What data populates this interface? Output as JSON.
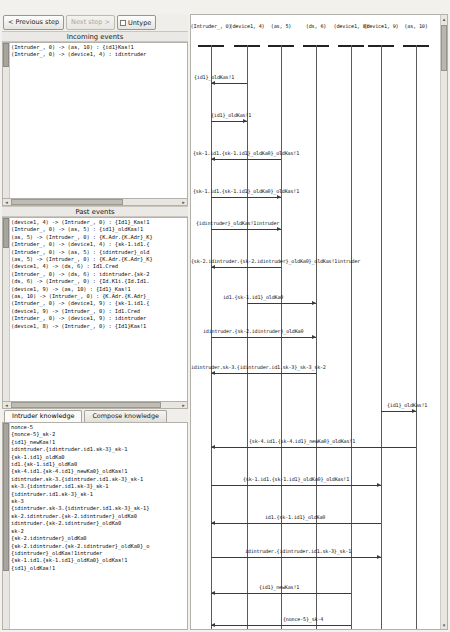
{
  "toolbar": {
    "previous_step_label": "< Previous step",
    "next_step_label": "Next step >",
    "untype_label": "Untype"
  },
  "incoming_events": {
    "title": "Incoming events",
    "rows": [
      "(Intruder_, 0) -> (as, 10) : {id1}Kas!1",
      "(Intruder_, 0) -> (device1, 4) : idintruder"
    ]
  },
  "past_events": {
    "title": "Past events",
    "rows": [
      "(device1, 4) -> (Intruder_, 0) : {Id1}_Kas!1",
      "(Intruder_, 0) -> (as, 5) : {id1}_oldKas!1",
      "(as, 5) -> (Intruder_, 0) : {K.Adr.{K.Adr}_K}",
      "(Intruder_, 0) -> (device1, 4) : {sk-1.id1.{",
      "(Intruder_, 0) -> (as, 5) : {idintruder}_old",
      "(as, 5) -> (Intruder_, 0) : {K.Adr.{K.Adr}_K}",
      "(device1, 4) -> (ds, 6) : Id1.Cred",
      "(Intruder_, 0) -> (ds, 6) : idintruder.{sk-2",
      "(ds, 6) -> (Intruder_, 0) : {Id.K1i.{Id.Id1.",
      "(device1, 9) -> (as, 10) : {Id1}_Kas!1",
      "(as, 10) -> (Intruder_, 0) : {K.Adr.{K.Adr}_",
      "(Intruder_, 0) -> (device1, 9) : {sk-1.id1.{",
      "(device1, 9) -> (Intruder_, 0) : Id1.Cred",
      "(Intruder_, 0) -> (device1, 9) : idintruder",
      "(device1, 8) -> (Intruder_, 0) : {Id1}Kas!1"
    ]
  },
  "knowledge_tabs": {
    "intruder_label": "Intruder knowledge",
    "compose_label": "Compose knowledge",
    "active": "intruder"
  },
  "intruder_knowledge": {
    "rows": [
      "nonce-5",
      "{nonce-5}_sk-2",
      "{id1}_newKas!1",
      "idintruder.{idintruder.id1.sk-3}_sk-1",
      "{sk-1.id1}_oldKa0",
      "id1.{sk-1.id1}_oldKa0",
      "{sk-4.id1.{sk-4.id1}_newKa0}_oldKas!1",
      "idintruder.sk-3.{idintruder.id1.sk-3}_sk-1",
      "sk-3.{idintruder.id1.sk-3}_sk-1",
      "{idintruder.id1.sk-3}_sk-1",
      "sk-3",
      "{idintruder.sk-3.{idintruder.id1.sk-3}_sk-1}",
      "sk-2.idintruder.{sk-2.idintruder}_oldKa0",
      "idintruder.{sk-2.idintruder}_oldKa0",
      "sk-2",
      "{sk-2.idintruder}_oldKa0",
      "{sk-2.idintruder.{sk-2.idintruder}_oldKa0}_o",
      "{idintruder}_oldKas!1intruder",
      "{sk-1.id1.{sk-1.id1}_oldKa0}_oldKas!1",
      "{id1}_oldKas!1"
    ]
  },
  "diagram": {
    "lifelines": [
      "(Intruder_, 0)",
      "(device1, 4)",
      "(as, 5)",
      "(ds, 6)",
      "(device1, 8)",
      "(device1, 9)",
      "(as, 10)"
    ],
    "messages": [
      {
        "label": "{id1}_oldKas!1",
        "from": 1,
        "to": 0,
        "y": 68,
        "label_x": 3,
        "label_align": "left"
      },
      {
        "label": "{id1}_oldKas!1",
        "from": 0,
        "to": 1,
        "y": 106,
        "label_x": 20,
        "label_align": "left"
      },
      {
        "label": "{sk-1.id1.{sk-1.id1}_oldKa0}_oldKas!1",
        "from": 2,
        "to": 0,
        "y": 144,
        "label_x": 2,
        "label_align": "left"
      },
      {
        "label": "{sk-1.id1.{sk-1.id1}_oldKa0}_oldKas!1",
        "from": 0,
        "to": 2,
        "y": 182,
        "label_x": 2,
        "label_align": "left"
      },
      {
        "label": "{idintruder}_oldKas!1intruder",
        "from": 0,
        "to": 2,
        "y": 214,
        "label_x": 5,
        "label_align": "left"
      },
      {
        "label": "{sk-2.idintruder.{sk-2.idintruder}_oldKa0}_oldKas!1intruder",
        "from": 2,
        "to": 0,
        "y": 252,
        "label_x": 0,
        "label_align": "left"
      },
      {
        "label": "id1.{sk-1.id1}_oldKa0",
        "from": 1,
        "to": 3,
        "y": 288,
        "label_x": 32,
        "label_align": "left"
      },
      {
        "label": "idintruder.{sk-2.idintruder}_oldKa0",
        "from": 0,
        "to": 3,
        "y": 322,
        "label_x": 12,
        "label_align": "left"
      },
      {
        "label": "idintruder.sk-3.{idintruder.id1.sk-3}_sk-3_sk-2",
        "from": 3,
        "to": 0,
        "y": 358,
        "label_x": 0,
        "label_align": "left"
      },
      {
        "label": "{id1}_oldKas!1",
        "from": 5,
        "to": 6,
        "y": 396,
        "label_x": 196,
        "label_align": "left"
      },
      {
        "label": "{sk-4.id1.{sk-4.id1}_newKa0}_oldKas!1",
        "from": 6,
        "to": 0,
        "y": 432,
        "label_x": 58,
        "label_align": "left"
      },
      {
        "label": "{sk-1.id1.{sk-1.id1}_oldKa0}_oldKas!1",
        "from": 0,
        "to": 5,
        "y": 470,
        "label_x": 52,
        "label_align": "left"
      },
      {
        "label": "id1.{sk-1.id1}_oldKa0",
        "from": 5,
        "to": 0,
        "y": 508,
        "label_x": 74,
        "label_align": "left"
      },
      {
        "label": "idintruder.{idintruder.id1.sk-3}_sk-1",
        "from": 0,
        "to": 5,
        "y": 542,
        "label_x": 54,
        "label_align": "left"
      },
      {
        "label": "{id1}_newKas!1",
        "from": 4,
        "to": 0,
        "y": 578,
        "label_x": 68,
        "label_align": "left"
      },
      {
        "label": "{nonce-5}_sk-4",
        "from": 4,
        "to": 0,
        "y": 610,
        "label_x": 92,
        "label_align": "left"
      }
    ]
  }
}
